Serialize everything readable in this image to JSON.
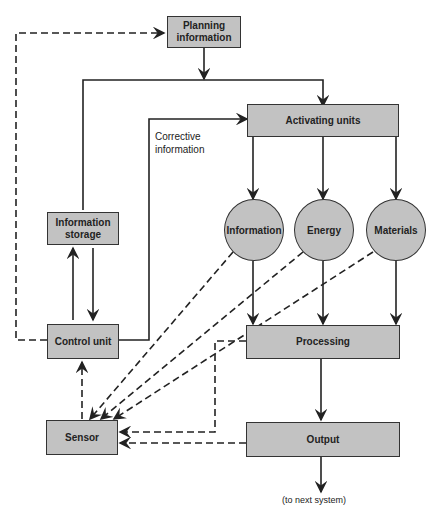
{
  "diagram": {
    "nodes": {
      "planning": "Planning information",
      "activating": "Activating units",
      "info_storage": "Information storage",
      "control_unit": "Control unit",
      "information": "Information",
      "energy": "Energy",
      "materials": "Materials",
      "processing": "Processing",
      "sensor": "Sensor",
      "output": "Output"
    },
    "labels": {
      "corrective_line1": "Corrective",
      "corrective_line2": "information",
      "to_next": "(to next system)"
    },
    "colors": {
      "box_fill": "#c2c2c2",
      "line": "#222222"
    }
  }
}
